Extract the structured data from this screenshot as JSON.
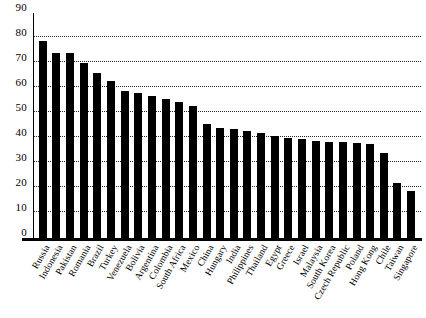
{
  "chart_data": {
    "type": "bar",
    "title": "",
    "subtitle": "",
    "xlabel": "",
    "ylabel": "",
    "ylim": [
      0,
      90
    ],
    "yticks": [
      0,
      10,
      20,
      30,
      40,
      50,
      60,
      70,
      80,
      90
    ],
    "grid": "horizontal-dotted",
    "legend": "none",
    "bar_color": "#000000",
    "categories": [
      "Russia",
      "Indonesia",
      "Pakistan",
      "Romania",
      "Brazil",
      "Turkey",
      "Venezuela",
      "Bolivia",
      "Argentina",
      "Colombia",
      "South Africa",
      "Mexico",
      "China",
      "Hungary",
      "India",
      "Philippines",
      "Thailand",
      "Egypt",
      "Greece",
      "Israel",
      "Malaysia",
      "South Korea",
      "Czech Republic",
      "Poland",
      "Hong Kong",
      "Chile",
      "Taiwan",
      "Singapore"
    ],
    "values": [
      79,
      74,
      74,
      70,
      66,
      63,
      59,
      58,
      57,
      55.5,
      54.5,
      53,
      45.5,
      44,
      43.5,
      43,
      42,
      41,
      40,
      39.5,
      39,
      38.5,
      38.5,
      38,
      37.5,
      34,
      22,
      19
    ]
  }
}
